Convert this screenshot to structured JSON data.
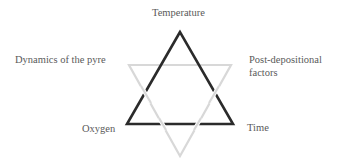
{
  "diagram": {
    "type": "hexagram",
    "triangles": [
      {
        "name": "combustion-triangle",
        "color": "#2b2b2b",
        "vertices": [
          "Temperature",
          "Oxygen",
          "Time"
        ]
      },
      {
        "name": "context-triangle",
        "color": "#d6d6d6",
        "vertices": [
          "Dynamics of the pyre",
          "Post-depositional factors",
          ""
        ]
      }
    ],
    "labels": {
      "temperature": "Temperature",
      "dynamics": "Dynamics of the pyre",
      "post_line1": "Post-depositional",
      "post_line2": "factors",
      "oxygen": "Oxygen",
      "time": "Time"
    }
  }
}
